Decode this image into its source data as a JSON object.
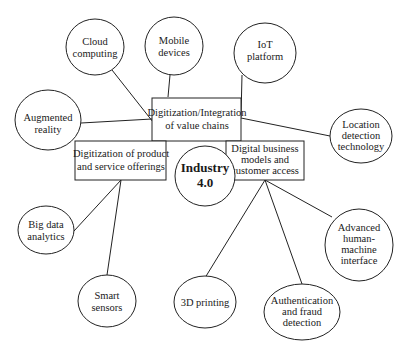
{
  "diagram": {
    "center": {
      "id": "industry40",
      "lines": [
        "Industry",
        "4.0"
      ]
    },
    "pillars": [
      {
        "id": "value-chains",
        "lines": [
          "Digitization/Integration",
          "of value chains"
        ]
      },
      {
        "id": "products",
        "lines": [
          "Digitization of product",
          "and service offerings"
        ]
      },
      {
        "id": "business-models",
        "lines": [
          "Digital business",
          "models and",
          "customer access"
        ]
      }
    ],
    "technologies": [
      {
        "id": "cloud",
        "lines": [
          "Cloud",
          "computing"
        ],
        "connects_to": "value-chains"
      },
      {
        "id": "mobile",
        "lines": [
          "Mobile",
          "devices"
        ],
        "connects_to": "value-chains"
      },
      {
        "id": "iot",
        "lines": [
          "IoT",
          "platform"
        ],
        "connects_to": "value-chains"
      },
      {
        "id": "ar",
        "lines": [
          "Augmented",
          "reality"
        ],
        "connects_to": "value-chains"
      },
      {
        "id": "location",
        "lines": [
          "Location",
          "detection",
          "technology"
        ],
        "connects_to": "value-chains"
      },
      {
        "id": "bigdata",
        "lines": [
          "Big data",
          "analytics"
        ],
        "connects_to": "products"
      },
      {
        "id": "sensors",
        "lines": [
          "Smart",
          "sensors"
        ],
        "connects_to": "products"
      },
      {
        "id": "printing",
        "lines": [
          "3D printing"
        ],
        "connects_to": "business-models"
      },
      {
        "id": "auth",
        "lines": [
          "Authentication",
          "and fraud",
          "detection"
        ],
        "connects_to": "business-models"
      },
      {
        "id": "hmi",
        "lines": [
          "Advanced",
          "human-",
          "machine",
          "interface"
        ],
        "connects_to": "business-models"
      }
    ],
    "colors": {
      "stroke": "#222222",
      "background": "#ffffff",
      "text": "#1a1a1a"
    }
  }
}
